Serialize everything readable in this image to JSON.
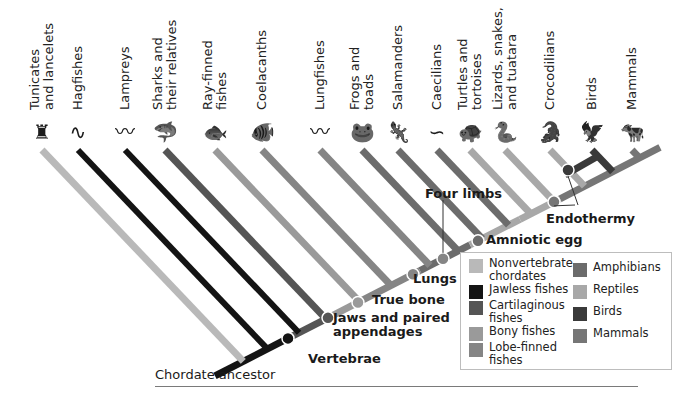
{
  "taxa": [
    {
      "name": "Tunicates and lancelets",
      "lines": [
        "Tunicates",
        "and lancelets"
      ],
      "group": "nonvertebrate",
      "icon": "tunicate-icon"
    },
    {
      "name": "Hagfishes",
      "lines": [
        "Hagfishes"
      ],
      "group": "jawless",
      "icon": "hagfish-icon"
    },
    {
      "name": "Lampreys",
      "lines": [
        "Lampreys"
      ],
      "group": "jawless",
      "icon": "lamprey-icon"
    },
    {
      "name": "Sharks and their relatives",
      "lines": [
        "Sharks and",
        "their relatives"
      ],
      "group": "cartilaginous",
      "icon": "shark-icon"
    },
    {
      "name": "Ray-finned fishes",
      "lines": [
        "Ray-finned",
        "fishes"
      ],
      "group": "bony",
      "icon": "ray-finned-fish-icon"
    },
    {
      "name": "Coelacanths",
      "lines": [
        "Coelacanths"
      ],
      "group": "lobe",
      "icon": "coelacanth-icon"
    },
    {
      "name": "Lungfishes",
      "lines": [
        "Lungfishes"
      ],
      "group": "lobe",
      "icon": "lungfish-icon"
    },
    {
      "name": "Frogs and toads",
      "lines": [
        "Frogs and",
        "toads"
      ],
      "group": "amphibian",
      "icon": "frog-icon"
    },
    {
      "name": "Salamanders",
      "lines": [
        "Salamanders"
      ],
      "group": "amphibian",
      "icon": "salamander-icon"
    },
    {
      "name": "Caecilians",
      "lines": [
        "Caecilians"
      ],
      "group": "amphibian",
      "icon": "caecilian-icon"
    },
    {
      "name": "Turtles and tortoises",
      "lines": [
        "Turtles and",
        "tortoises"
      ],
      "group": "reptile",
      "icon": "turtle-icon"
    },
    {
      "name": "Lizards, snakes, and tuatara",
      "lines": [
        "Lizards, snakes,",
        "and tuatara"
      ],
      "group": "reptile",
      "icon": "snake-icon"
    },
    {
      "name": "Crocodilians",
      "lines": [
        "Crocodilians"
      ],
      "group": "reptile",
      "icon": "crocodile-icon"
    },
    {
      "name": "Birds",
      "lines": [
        "Birds"
      ],
      "group": "bird",
      "icon": "bird-icon"
    },
    {
      "name": "Mammals",
      "lines": [
        "Mammals"
      ],
      "group": "mammal",
      "icon": "cow-icon"
    }
  ],
  "traits": {
    "vertebrae": "Vertebrae",
    "jaws_line1": "Jaws and paired",
    "jaws_line2": "appendages",
    "true_bone": "True bone",
    "lungs": "Lungs",
    "four_limbs": "Four limbs",
    "amniotic_egg": "Amniotic egg",
    "endothermy": "Endothermy"
  },
  "ancestor_label": "Chordate ancestor",
  "legend": [
    {
      "key": "nonvertebrate",
      "lines": [
        "Nonvertebrate",
        "chordates"
      ],
      "color": "#b9b9b9"
    },
    {
      "key": "jawless",
      "lines": [
        "Jawless fishes"
      ],
      "color": "#141414"
    },
    {
      "key": "cartilaginous",
      "lines": [
        "Cartilaginous",
        "fishes"
      ],
      "color": "#555555"
    },
    {
      "key": "bony",
      "lines": [
        "Bony fishes"
      ],
      "color": "#9a9a9a"
    },
    {
      "key": "lobe",
      "lines": [
        "Lobe-finned",
        "fishes"
      ],
      "color": "#858585"
    },
    {
      "key": "amphibian",
      "lines": [
        "Amphibians"
      ],
      "color": "#6c6c6c"
    },
    {
      "key": "reptile",
      "lines": [
        "Reptiles"
      ],
      "color": "#a8a8a8"
    },
    {
      "key": "bird",
      "lines": [
        "Birds"
      ],
      "color": "#3a3a3a"
    },
    {
      "key": "mammal",
      "lines": [
        "Mammals"
      ],
      "color": "#767676"
    }
  ]
}
